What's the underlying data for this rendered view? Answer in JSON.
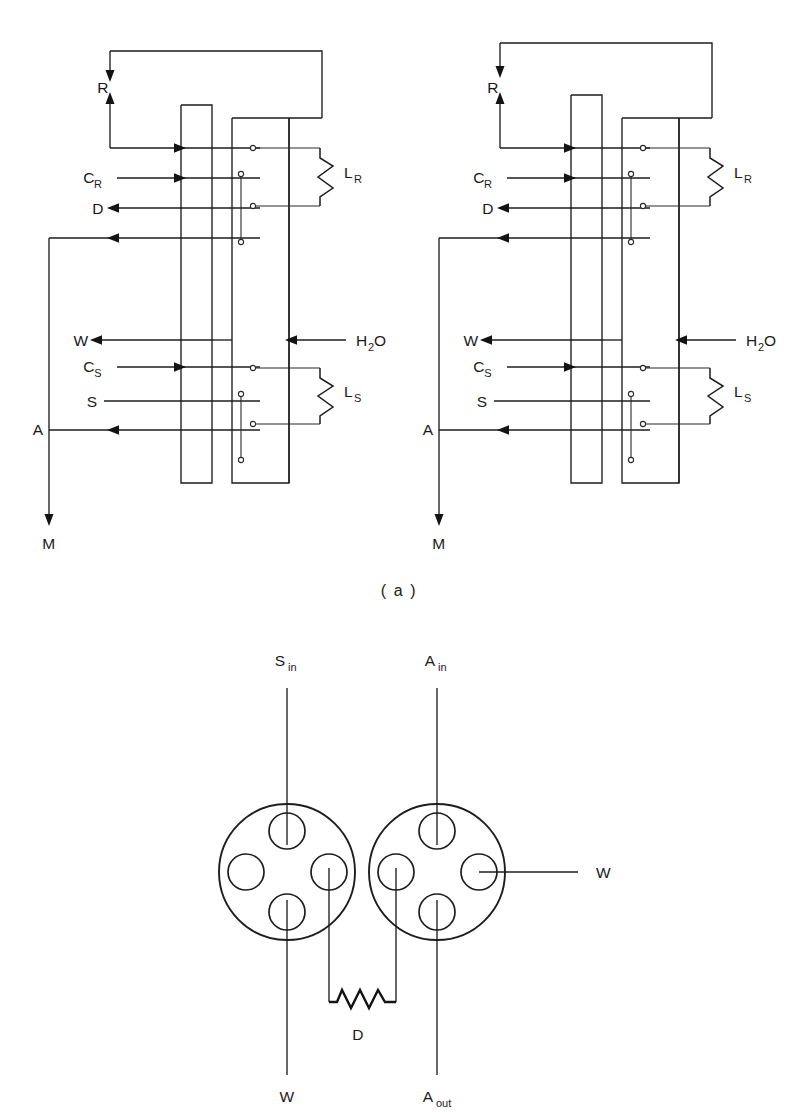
{
  "figure": {
    "panel_label": "( a )",
    "background_color": "#ffffff",
    "ink_color": "#1d1d1d"
  },
  "schematic": {
    "type": "fluidic-chromatography-valve-schematic",
    "units": [
      {
        "name": "left-unit",
        "ports": [
          {
            "id": "R",
            "label": "R",
            "label_sub": "",
            "direction": "bidirectional",
            "note": "recycle loop, down-arrow and up-arrow"
          },
          {
            "id": "CR",
            "label": "C",
            "label_sub": "R",
            "direction": "in"
          },
          {
            "id": "D",
            "label": "D",
            "label_sub": "",
            "direction": "out"
          },
          {
            "id": "W",
            "label": "W",
            "label_sub": "",
            "direction": "out"
          },
          {
            "id": "CS",
            "label": "C",
            "label_sub": "S",
            "direction": "in"
          },
          {
            "id": "S",
            "label": "S",
            "label_sub": "",
            "direction": "in"
          },
          {
            "id": "A",
            "label": "A",
            "label_sub": "",
            "direction": "in"
          },
          {
            "id": "M",
            "label": "M",
            "label_sub": "",
            "direction": "out"
          },
          {
            "id": "H2O",
            "label": "H",
            "label_sub": "2",
            "label_tail": "O",
            "direction": "in"
          }
        ],
        "columns": [
          {
            "id": "LR",
            "label": "L",
            "label_sub": "R",
            "note": "reference column coil"
          },
          {
            "id": "LS",
            "label": "L",
            "label_sub": "S",
            "note": "sample column coil"
          }
        ]
      },
      {
        "name": "right-unit",
        "ports": [
          {
            "id": "R",
            "label": "R",
            "label_sub": "",
            "direction": "bidirectional"
          },
          {
            "id": "CR",
            "label": "C",
            "label_sub": "R",
            "direction": "in"
          },
          {
            "id": "D",
            "label": "D",
            "label_sub": "",
            "direction": "out"
          },
          {
            "id": "W",
            "label": "W",
            "label_sub": "",
            "direction": "out"
          },
          {
            "id": "CS",
            "label": "C",
            "label_sub": "S",
            "direction": "in"
          },
          {
            "id": "S",
            "label": "S",
            "label_sub": "",
            "direction": "in"
          },
          {
            "id": "A",
            "label": "A",
            "label_sub": "",
            "direction": "in"
          },
          {
            "id": "M",
            "label": "M",
            "label_sub": "",
            "direction": "out"
          },
          {
            "id": "H2O",
            "label": "H",
            "label_sub": "2",
            "label_tail": "O",
            "direction": "in"
          }
        ],
        "columns": [
          {
            "id": "LR",
            "label": "L",
            "label_sub": "R"
          },
          {
            "id": "LS",
            "label": "L",
            "label_sub": "S"
          }
        ]
      }
    ]
  },
  "connector_diagram": {
    "type": "rotary-valve-face-view",
    "connectors": [
      {
        "name": "left-connector",
        "ports": 4,
        "lines": [
          {
            "id": "Sin",
            "label": "S",
            "label_sub": "in",
            "position": "top"
          },
          {
            "id": "W-out",
            "label": "W",
            "label_sub": "",
            "position": "bottom"
          },
          {
            "id": "D-right",
            "label": "",
            "label_sub": "",
            "position": "bottom-right"
          }
        ]
      },
      {
        "name": "right-connector",
        "ports": 4,
        "lines": [
          {
            "id": "Ain",
            "label": "A",
            "label_sub": "in",
            "position": "top"
          },
          {
            "id": "W-right",
            "label": "W",
            "label_sub": "",
            "position": "right"
          },
          {
            "id": "Aout",
            "label": "A",
            "label_sub": "out",
            "position": "bottom"
          },
          {
            "id": "D-left",
            "label": "",
            "label_sub": "",
            "position": "bottom-left"
          }
        ]
      }
    ],
    "resistor": {
      "id": "D",
      "label": "D",
      "label_sub": ""
    }
  },
  "labels": {
    "R": "R",
    "C": "C",
    "sub_R": "R",
    "sub_S": "S",
    "D": "D",
    "W": "W",
    "S": "S",
    "A": "A",
    "M": "M",
    "L": "L",
    "H": "H",
    "sub_2": "2",
    "O": "O",
    "sub_in": "in",
    "sub_out": "out",
    "panel_a": "( a )"
  }
}
